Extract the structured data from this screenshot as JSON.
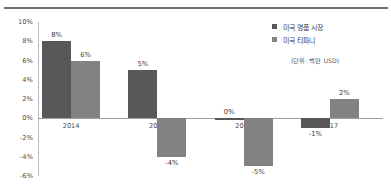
{
  "chart_data": {
    "type": "bar",
    "title": "",
    "xlabel": "",
    "ylabel": "",
    "categories": [
      "2014",
      "2015",
      "2016",
      "2017"
    ],
    "series": [
      {
        "name": "미국 명품 시장",
        "color": "#58585a",
        "values": [
          8,
          5,
          0,
          -1
        ],
        "value_labels": [
          "8%",
          "5%",
          "0%",
          "-1%"
        ]
      },
      {
        "name": "미국 티파니",
        "color": "#828285",
        "values": [
          6,
          -4,
          -5,
          2
        ],
        "value_labels": [
          "6%",
          "-4%",
          "-5%",
          "2%"
        ]
      }
    ],
    "ylim": [
      -6,
      10
    ],
    "ytick_values": [
      10,
      8,
      6,
      4,
      2,
      0,
      -2,
      -4,
      -6
    ],
    "ytick_labels": [
      "10%",
      "8%",
      "6%",
      "4%",
      "2%",
      "0%",
      "-2%",
      "-4%",
      "-6%"
    ],
    "grid": false,
    "legend_position": "top-right",
    "unit_note": "(단위: 백만 USD)"
  },
  "legend": {
    "items": [
      {
        "label": "미국 명품 시장"
      },
      {
        "label": "미국 티파니"
      }
    ]
  },
  "annotations": {
    "unit_note": "(단위: 백만 USD)"
  }
}
